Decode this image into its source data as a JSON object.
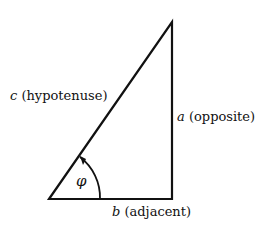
{
  "diagram": {
    "type": "right-triangle",
    "stroke_color": "#111111",
    "background": "#ffffff",
    "sides": {
      "hypotenuse": {
        "symbol": "c",
        "name": "(hypotenuse)"
      },
      "opposite": {
        "symbol": "a",
        "name": "(opposite)"
      },
      "adjacent": {
        "symbol": "b",
        "name": "(adjacent)"
      }
    },
    "angle": {
      "symbol": "φ"
    }
  }
}
